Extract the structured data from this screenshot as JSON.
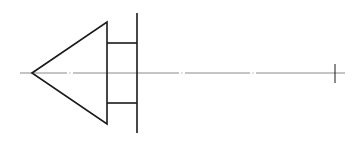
{
  "diagram": {
    "title": "",
    "colors": {
      "background": "#ffffff",
      "outline": "#1a1a1a",
      "centerline": "#8a8a8a"
    },
    "shapes": {
      "cone": {
        "tip": [
          32,
          73
        ],
        "top": [
          107,
          22
        ],
        "bottom": [
          107,
          124
        ]
      },
      "neck": {
        "x1": 107,
        "x2": 137,
        "y_top": 43,
        "y_bottom": 103
      },
      "plate": {
        "x": 137,
        "y_top": 13,
        "y_bottom": 133
      },
      "centerline": {
        "y": 73,
        "x_start": 20,
        "x_end": 345,
        "gaps": [
          70,
          182,
          253
        ]
      },
      "end_tick": {
        "x": 335,
        "y_top": 64,
        "y_bottom": 83
      }
    }
  }
}
